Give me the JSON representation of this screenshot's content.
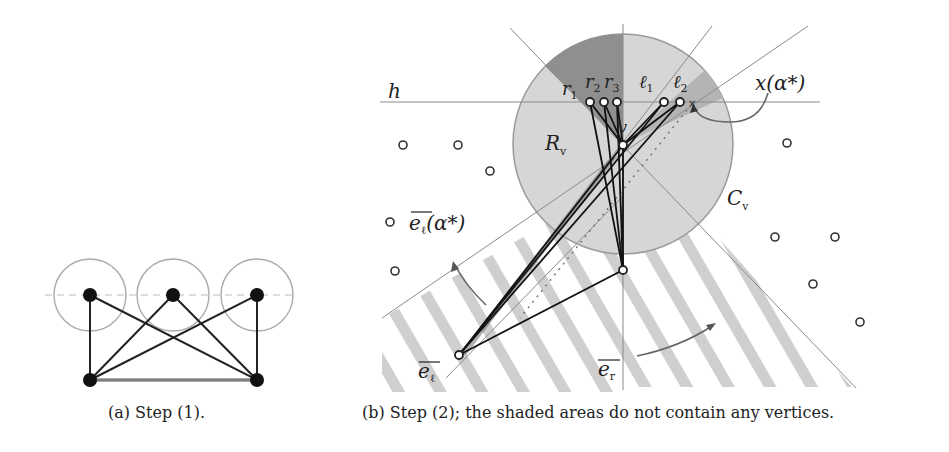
{
  "figure": {
    "panel_a": {
      "caption": "(a) Step (1).",
      "top_vertices": [
        [
          90,
          295
        ],
        [
          173,
          295
        ],
        [
          257,
          295
        ]
      ],
      "bottom_vertices": [
        [
          90,
          380
        ],
        [
          257,
          380
        ]
      ],
      "circle_radius": 36
    },
    "panel_b": {
      "caption": "(b) Step (2); the shaded areas do not contain any vertices.",
      "labels": {
        "h": "h",
        "r1": "r",
        "r1_sub": "1",
        "r2": "r",
        "r2_sub": "2",
        "r3": "r",
        "r3_sub": "3",
        "l1": "ℓ",
        "l1_sub": "1",
        "l2": "ℓ",
        "l2_sub": "2",
        "x_alpha": "x(α*)",
        "v": "v",
        "R": "R",
        "R_sub": "v",
        "C": "C",
        "C_sub": "v",
        "el_alpha": "e",
        "el_alpha_sub": "ℓ",
        "el_alpha_suffix": "(α*)",
        "el": "e",
        "el_sub": "ℓ",
        "er": "e",
        "er_sub": "r"
      },
      "disk": {
        "cx": 623,
        "cy": 144,
        "r": 110
      },
      "vertices": {
        "v": [
          623,
          145
        ],
        "r1": [
          590,
          102
        ],
        "r2": [
          604,
          102
        ],
        "r3": [
          617,
          102
        ],
        "l1": [
          664,
          102
        ],
        "l2": [
          680,
          102
        ],
        "bottom": [
          623,
          270
        ],
        "el": [
          459,
          355
        ]
      },
      "other_points": [
        [
          403,
          145
        ],
        [
          458,
          145
        ],
        [
          490,
          171
        ],
        [
          390,
          222
        ],
        [
          395,
          271
        ],
        [
          787,
          143
        ],
        [
          775,
          237
        ],
        [
          835,
          237
        ],
        [
          813,
          284
        ],
        [
          860,
          322
        ]
      ]
    }
  }
}
